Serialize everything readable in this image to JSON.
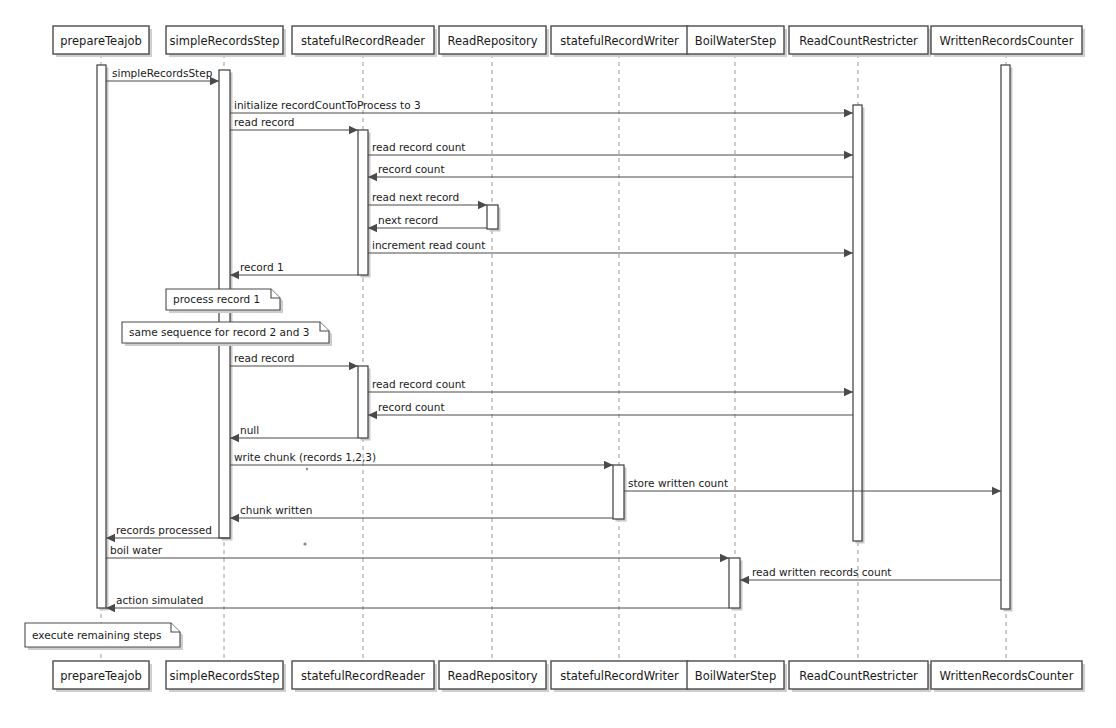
{
  "diagram": {
    "kind": "uml-sequence-diagram",
    "width": 1116,
    "height": 728,
    "background_color": "#ffffff",
    "line_color": "#4a4a4a",
    "lifeline_color": "#9a9a9a",
    "text_color": "#1a1a1a",
    "shadow_color": "#cfcfcf"
  },
  "lifelines": [
    {
      "id": "prepareTeajob",
      "label": "prepareTeajob",
      "x": 101,
      "box_left": 53,
      "box_width": 96
    },
    {
      "id": "simpleRecordsStep",
      "label": "simpleRecordsStep",
      "x": 224,
      "box_left": 166,
      "box_width": 117
    },
    {
      "id": "statefulRecordReader",
      "label": "statefulRecordReader",
      "x": 363,
      "box_left": 292,
      "box_width": 142
    },
    {
      "id": "ReadRepository",
      "label": "ReadRepository",
      "x": 492,
      "box_left": 439,
      "box_width": 107
    },
    {
      "id": "statefulRecordWriter",
      "label": "statefulRecordWriter",
      "x": 619,
      "box_left": 551,
      "box_width": 137
    },
    {
      "id": "BoilWaterStep",
      "label": "BoilWaterStep",
      "x": 735,
      "box_left": 687,
      "box_width": 97
    },
    {
      "id": "ReadCountRestricter",
      "label": "ReadCountRestricter",
      "x": 858,
      "box_left": 789,
      "box_width": 139
    },
    {
      "id": "WrittenRecordsCounter",
      "label": "WrittenRecordsCounter",
      "x": 1006,
      "box_left": 931,
      "box_width": 151
    }
  ],
  "header_boxes": {
    "y": 26,
    "height": 28
  },
  "footer_boxes": {
    "y": 661,
    "height": 28
  },
  "activations": [
    {
      "id": "act-prepareTeajob",
      "lifeline": "prepareTeajob",
      "x": 97,
      "y": 65,
      "width": 9,
      "height": 543
    },
    {
      "id": "act-simpleRecordsStep",
      "lifeline": "simpleRecordsStep",
      "x": 219,
      "y": 70,
      "width": 11,
      "height": 468
    },
    {
      "id": "act-reader-1",
      "lifeline": "statefulRecordReader",
      "x": 358,
      "y": 130,
      "width": 10,
      "height": 145
    },
    {
      "id": "act-repository-1",
      "lifeline": "ReadRepository",
      "x": 487,
      "y": 205,
      "width": 11,
      "height": 24
    },
    {
      "id": "act-reader-2",
      "lifeline": "statefulRecordReader",
      "x": 358,
      "y": 366,
      "width": 10,
      "height": 72
    },
    {
      "id": "act-writer-1",
      "lifeline": "statefulRecordWriter",
      "x": 613,
      "y": 465,
      "width": 11,
      "height": 54
    },
    {
      "id": "act-boilwater-1",
      "lifeline": "BoilWaterStep",
      "x": 729,
      "y": 558,
      "width": 11,
      "height": 50
    },
    {
      "id": "act-readcount-1",
      "lifeline": "ReadCountRestricter",
      "x": 853,
      "y": 105,
      "width": 9,
      "height": 436
    },
    {
      "id": "act-writtencounter-1",
      "lifeline": "WrittenRecordsCounter",
      "x": 1001,
      "y": 65,
      "width": 9,
      "height": 544
    }
  ],
  "messages": [
    {
      "id": "m1",
      "label": "simpleRecordsStep",
      "from": "prepareTeajob",
      "to": "simpleRecordsStep",
      "y": 81,
      "x1": 106,
      "x2": 219,
      "direction": "right",
      "dashed": false,
      "label_x": 112
    },
    {
      "id": "m2",
      "label": "initialize recordCountToProcess to 3",
      "from": "simpleRecordsStep",
      "to": "ReadCountRestricter",
      "y": 113,
      "x1": 230,
      "x2": 853,
      "direction": "right",
      "dashed": false,
      "label_x": 234
    },
    {
      "id": "m3",
      "label": "read record",
      "from": "simpleRecordsStep",
      "to": "statefulRecordReader",
      "y": 130,
      "x1": 230,
      "x2": 358,
      "direction": "right",
      "dashed": false,
      "label_x": 234
    },
    {
      "id": "m4",
      "label": "read record count",
      "from": "statefulRecordReader",
      "to": "ReadCountRestricter",
      "y": 155,
      "x1": 368,
      "x2": 853,
      "direction": "right",
      "dashed": false,
      "label_x": 372
    },
    {
      "id": "m5",
      "label": "record count",
      "from": "ReadCountRestricter",
      "to": "statefulRecordReader",
      "y": 177,
      "x1": 853,
      "x2": 368,
      "direction": "left",
      "dashed": false,
      "label_x": 378
    },
    {
      "id": "m6",
      "label": "read next record",
      "from": "statefulRecordReader",
      "to": "ReadRepository",
      "y": 205,
      "x1": 368,
      "x2": 487,
      "direction": "right",
      "dashed": false,
      "label_x": 372
    },
    {
      "id": "m7",
      "label": "next record",
      "from": "ReadRepository",
      "to": "statefulRecordReader",
      "y": 228,
      "x1": 487,
      "x2": 368,
      "direction": "left",
      "dashed": false,
      "label_x": 378
    },
    {
      "id": "m8",
      "label": "increment read count",
      "from": "statefulRecordReader",
      "to": "ReadCountRestricter",
      "y": 253,
      "x1": 368,
      "x2": 853,
      "direction": "right",
      "dashed": false,
      "label_x": 372
    },
    {
      "id": "m9",
      "label": "record 1",
      "from": "statefulRecordReader",
      "to": "simpleRecordsStep",
      "y": 275,
      "x1": 358,
      "x2": 230,
      "direction": "left",
      "dashed": false,
      "label_x": 240
    },
    {
      "id": "m10",
      "label": "read record",
      "from": "simpleRecordsStep",
      "to": "statefulRecordReader",
      "y": 366,
      "x1": 230,
      "x2": 358,
      "direction": "right",
      "dashed": false,
      "label_x": 234
    },
    {
      "id": "m11",
      "label": "read record count",
      "from": "statefulRecordReader",
      "to": "ReadCountRestricter",
      "y": 392,
      "x1": 368,
      "x2": 853,
      "direction": "right",
      "dashed": false,
      "label_x": 372
    },
    {
      "id": "m12",
      "label": "record count",
      "from": "ReadCountRestricter",
      "to": "statefulRecordReader",
      "y": 415,
      "x1": 853,
      "x2": 368,
      "direction": "left",
      "dashed": false,
      "label_x": 378
    },
    {
      "id": "m13",
      "label": "null",
      "from": "statefulRecordReader",
      "to": "simpleRecordsStep",
      "y": 438,
      "x1": 358,
      "x2": 230,
      "direction": "left",
      "dashed": false,
      "label_x": 240
    },
    {
      "id": "m14",
      "label": "write chunk (records 1,2,3)",
      "from": "simpleRecordsStep",
      "to": "statefulRecordWriter",
      "y": 465,
      "x1": 230,
      "x2": 613,
      "direction": "right",
      "dashed": false,
      "label_x": 234
    },
    {
      "id": "m15",
      "label": "store written count",
      "from": "statefulRecordWriter",
      "to": "WrittenRecordsCounter",
      "y": 491,
      "x1": 624,
      "x2": 1001,
      "direction": "right",
      "dashed": false,
      "label_x": 628
    },
    {
      "id": "m16",
      "label": "chunk written",
      "from": "statefulRecordWriter",
      "to": "simpleRecordsStep",
      "y": 518,
      "x1": 613,
      "x2": 230,
      "direction": "left",
      "dashed": false,
      "label_x": 240
    },
    {
      "id": "m17",
      "label": "records processed",
      "from": "simpleRecordsStep",
      "to": "prepareTeajob",
      "y": 538,
      "x1": 230,
      "x2": 106,
      "direction": "left",
      "dashed": false,
      "label_x": 116
    },
    {
      "id": "m18",
      "label": "boil water",
      "from": "prepareTeajob",
      "to": "BoilWaterStep",
      "y": 558,
      "x1": 106,
      "x2": 729,
      "direction": "right",
      "dashed": false,
      "label_x": 110
    },
    {
      "id": "m19",
      "label": "read written records count",
      "from": "WrittenRecordsCounter",
      "to": "BoilWaterStep",
      "y": 580,
      "x1": 1001,
      "x2": 740,
      "direction": "left",
      "dashed": false,
      "label_x": 752
    },
    {
      "id": "m20",
      "label": "action simulated",
      "from": "BoilWaterStep",
      "to": "prepareTeajob",
      "y": 608,
      "x1": 729,
      "x2": 106,
      "direction": "left",
      "dashed": false,
      "label_x": 116
    }
  ],
  "notes": [
    {
      "id": "note-1",
      "label": "process record 1",
      "x": 166,
      "y": 289,
      "width": 114,
      "height": 21
    },
    {
      "id": "note-2",
      "label": "same sequence for record 2 and 3",
      "x": 122,
      "y": 322,
      "width": 207,
      "height": 21
    },
    {
      "id": "note-3",
      "label": "execute remaining steps",
      "x": 25,
      "y": 623,
      "width": 155,
      "height": 24
    }
  ],
  "specks": [
    {
      "id": "speck-1",
      "x": 305,
      "y": 544,
      "r": 1.6
    },
    {
      "id": "speck-2",
      "x": 307,
      "y": 469,
      "r": 1.2
    }
  ]
}
